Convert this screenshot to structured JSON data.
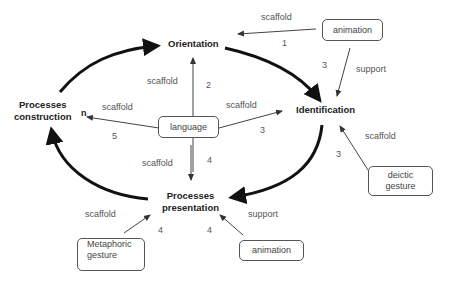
{
  "stages": {
    "orientation": "Orientation",
    "identification": "Identification",
    "presentation_line1": "Processes",
    "presentation_line2": "presentation",
    "construction_line1": "Processes",
    "construction_line2": "construction"
  },
  "boxes": {
    "language": "language",
    "animation_top": "animation",
    "deictic_line1": "deictic",
    "deictic_line2": "gesture",
    "metaphoric_line1": "Metaphoric",
    "metaphoric_line2": "gesture",
    "animation_bottom": "animation"
  },
  "edges": [
    {
      "from": "animation_top",
      "to": "orientation",
      "label": "scaffold",
      "number": "1"
    },
    {
      "from": "animation_top",
      "to": "identification",
      "label": "support",
      "number": "3"
    },
    {
      "from": "language",
      "to": "orientation",
      "label": "scaffold",
      "number": "2"
    },
    {
      "from": "language",
      "to": "identification",
      "label": "scaffold",
      "number": "3"
    },
    {
      "from": "language",
      "to": "construction",
      "label": "scaffold",
      "number": "5"
    },
    {
      "from": "language",
      "to": "presentation",
      "label": "scaffold",
      "number": "4"
    },
    {
      "from": "deictic_gesture",
      "to": "identification",
      "label": "scaffold",
      "number": "3"
    },
    {
      "from": "metaphoric_gesture",
      "to": "presentation",
      "label": "scaffold",
      "number": "4"
    },
    {
      "from": "animation_bottom",
      "to": "presentation",
      "label": "support",
      "number": "4"
    }
  ],
  "construction_target_marker": "n",
  "colors": {
    "cycle_arrow": "#111111",
    "thin_arrow": "#444444",
    "box_border": "#555555",
    "label_text": "#555555"
  }
}
